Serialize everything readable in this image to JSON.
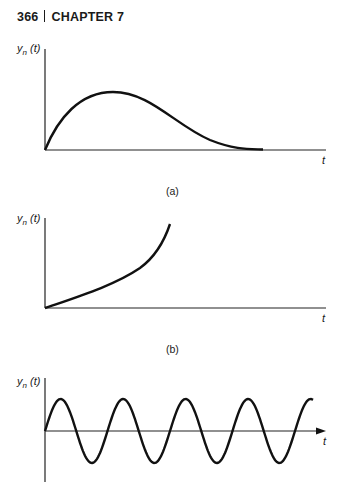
{
  "header": {
    "page_number": "366",
    "chapter": "CHAPTER 7"
  },
  "chart_data": [
    {
      "type": "line",
      "caption": "(a)",
      "title": "",
      "xlabel": "t",
      "ylabel": "y_n(t)",
      "grid": false,
      "description": "Rises from zero to a single maximum then decays back toward zero",
      "points": [
        [
          0,
          0
        ],
        [
          0.1,
          0.45
        ],
        [
          0.2,
          0.8
        ],
        [
          0.32,
          1.0
        ],
        [
          0.45,
          0.85
        ],
        [
          0.6,
          0.45
        ],
        [
          0.75,
          0.12
        ],
        [
          0.9,
          0.01
        ],
        [
          1.0,
          0
        ]
      ]
    },
    {
      "type": "line",
      "caption": "(b)",
      "title": "",
      "xlabel": "t",
      "ylabel": "y_n(t)",
      "grid": false,
      "description": "Monotonically increasing, growing without bound",
      "points": [
        [
          0,
          0
        ],
        [
          0.2,
          0.12
        ],
        [
          0.4,
          0.27
        ],
        [
          0.6,
          0.45
        ],
        [
          0.8,
          0.7
        ],
        [
          0.95,
          0.9
        ],
        [
          1.0,
          1.0
        ]
      ]
    },
    {
      "type": "line",
      "caption": "",
      "title": "",
      "xlabel": "t",
      "ylabel": "y_n(t)",
      "grid": false,
      "description": "Sustained sinusoidal oscillation of constant amplitude (about 4 cycles)",
      "amplitude": 1,
      "cycles": 4.3
    }
  ],
  "labels": {
    "ylabel_base": "y",
    "ylabel_sub": "n",
    "ylabel_arg": " (t)",
    "t": "t",
    "cap_a": "(a)",
    "cap_b": "(b)"
  }
}
